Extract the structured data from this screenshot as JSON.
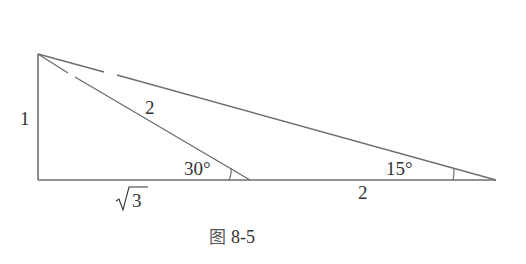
{
  "figure": {
    "caption": "图 8-5",
    "caption_prefix": "图",
    "caption_number": "8-5",
    "stroke_color": "#6e6e6e",
    "text_color": "#333333"
  },
  "geometry": {
    "vertices": {
      "A_top": [
        38,
        54
      ],
      "C_right_angle": [
        38,
        180
      ],
      "D_middle": [
        250,
        180
      ],
      "B_right": [
        496,
        180
      ]
    }
  },
  "labels": {
    "vertical_side": "1",
    "hypotenuse_small": "2",
    "base_left": "√3",
    "base_left_radicand": "3",
    "base_right": "2",
    "angle_middle": "30°",
    "angle_right": "15°"
  }
}
